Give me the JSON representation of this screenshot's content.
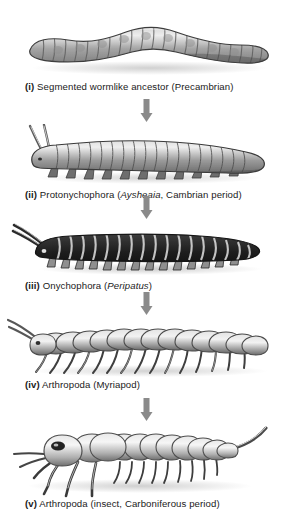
{
  "figure": {
    "background_color": "#ffffff",
    "arrow_color": "#8a8a8a",
    "caption_color": "#1a1a1a"
  },
  "panels": [
    {
      "id": "panel-i",
      "numeral": "(i)",
      "caption_rest": " Segmented wormlike ancestor (Precambrian)",
      "caption_full": "(i) Segmented wormlike ancestor (Precambrian)",
      "organism": "segmented-worm",
      "italic_name": "",
      "segments": 22,
      "body_tone": "#9a9a9a"
    },
    {
      "id": "panel-ii",
      "numeral": "(ii)",
      "caption_pre": " Protonychophora (",
      "italic_name": "Aysheaia",
      "caption_post": ", Cambrian period)",
      "caption_full": "(ii) Protonychophora (Aysheaia, Cambrian period)",
      "organism": "aysheaia-lobopod",
      "segments": 18,
      "body_tone": "#8d8d8d"
    },
    {
      "id": "panel-iii",
      "numeral": "(iii)",
      "caption_pre": " Onychophora (",
      "italic_name": "Peripatus",
      "caption_post": ")",
      "caption_full": "(iii) Onychophora (Peripatus)",
      "organism": "peripatus-velvet-worm",
      "segments": 20,
      "body_tone": "#4a4a4a"
    },
    {
      "id": "panel-iv",
      "numeral": "(iv)",
      "caption_rest": " Arthropoda (Myriapod)",
      "caption_full": "(iv) Arthropoda (Myriapod)",
      "organism": "myriapod-centipede",
      "segments": 15,
      "body_tone": "#b5b5b5"
    },
    {
      "id": "panel-v",
      "numeral": "(v)",
      "caption_rest": " Arthropoda (insect, Carboniferous period)",
      "caption_full": "(v) Arthropoda (insect, Carboniferous period)",
      "organism": "carboniferous-insect",
      "segments": 13,
      "body_tone": "#c4c4c4"
    }
  ],
  "arrows": [
    {
      "id": "arrow-i-ii",
      "direction": "down"
    },
    {
      "id": "arrow-ii-iii",
      "direction": "down"
    },
    {
      "id": "arrow-iii-iv",
      "direction": "down"
    },
    {
      "id": "arrow-iv-v",
      "direction": "down"
    }
  ]
}
